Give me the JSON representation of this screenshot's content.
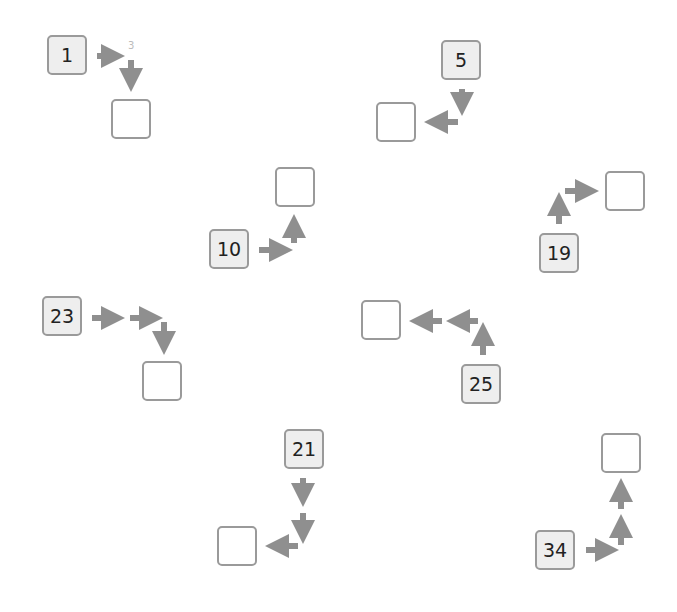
{
  "puzzle": {
    "arrow_color": "#8f8f8f",
    "box_border_color": "#9a9a9a",
    "start_fill_color": "#eeeeee",
    "items": [
      {
        "start": "1",
        "hint": "3",
        "answer": "",
        "path": [
          "right",
          "down"
        ]
      },
      {
        "start": "5",
        "answer": "",
        "path": [
          "down",
          "left"
        ]
      },
      {
        "start": "10",
        "answer": "",
        "path": [
          "right",
          "up"
        ]
      },
      {
        "start": "19",
        "answer": "",
        "path": [
          "up",
          "right"
        ]
      },
      {
        "start": "23",
        "answer": "",
        "path": [
          "right",
          "right",
          "down"
        ]
      },
      {
        "start": "25",
        "answer": "",
        "path": [
          "up",
          "left",
          "left"
        ]
      },
      {
        "start": "21",
        "answer": "",
        "path": [
          "down",
          "down",
          "left"
        ]
      },
      {
        "start": "34",
        "answer": "",
        "path": [
          "right",
          "up",
          "up"
        ]
      }
    ]
  }
}
